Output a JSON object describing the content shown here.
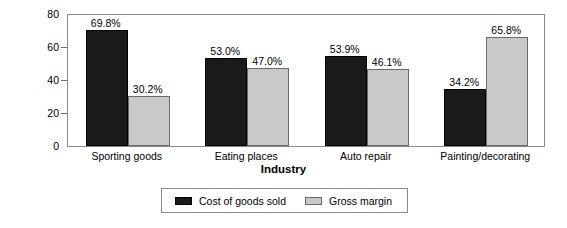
{
  "chart_data": {
    "type": "bar",
    "title": "",
    "xlabel": "Industry",
    "ylabel": "Percentage",
    "ylim": [
      0,
      80
    ],
    "yticks": [
      0,
      20,
      40,
      60,
      80
    ],
    "grid": false,
    "legend_position": "bottom",
    "categories": [
      "Sporting goods",
      "Eating places",
      "Auto repair",
      "Painting/decorating"
    ],
    "series": [
      {
        "name": "Cost of goods sold",
        "color": "#1a1a1a",
        "values": [
          69.8,
          53.0,
          53.9,
          34.2
        ],
        "labels": [
          "69.8%",
          "53.0%",
          "53.9%",
          "34.2%"
        ]
      },
      {
        "name": "Gross margin",
        "color": "#c9c9c9",
        "values": [
          30.2,
          47.0,
          46.1,
          65.8
        ],
        "labels": [
          "30.2%",
          "47.0%",
          "46.1%",
          "65.8%"
        ]
      }
    ]
  },
  "axis": {
    "y_title": "Percentage",
    "x_title": "Industry",
    "y_tick_labels": [
      "80",
      "60",
      "40",
      "20",
      "0"
    ]
  },
  "legend": {
    "entries": [
      {
        "label": "Cost of goods sold",
        "swatch": "dark"
      },
      {
        "label": "Gross margin",
        "swatch": "light"
      }
    ]
  }
}
